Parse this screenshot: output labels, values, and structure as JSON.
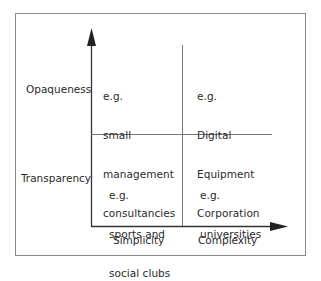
{
  "diagram": {
    "type": "2x2 matrix",
    "y_axis": {
      "high_label": "Opaqueness",
      "low_label": "Transparency"
    },
    "x_axis": {
      "low_label": "Simplicity",
      "high_label": "Complexity"
    },
    "quadrants": {
      "top_left": {
        "prefix": "e.g.",
        "lines": [
          "small",
          "management",
          "consultancies"
        ]
      },
      "top_right": {
        "prefix": "e.g.",
        "lines": [
          "Digital",
          "Equipment",
          "Corporation"
        ]
      },
      "bottom_left": {
        "prefix": "e.g.",
        "lines": [
          "sports and",
          "social clubs"
        ]
      },
      "bottom_right": {
        "prefix": "e.g.",
        "lines": [
          "universities"
        ]
      }
    }
  }
}
